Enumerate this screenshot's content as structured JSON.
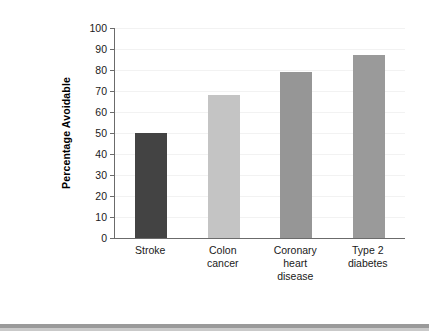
{
  "chart_data": {
    "type": "bar",
    "title": "",
    "subtitle": "",
    "xlabel": "",
    "ylabel": "Percentage Avoidable",
    "categories": [
      "Stroke",
      "Colon\ncancer",
      "Coronary\nheart\ndisease",
      "Type 2\ndiabetes"
    ],
    "values": [
      50,
      68,
      79,
      87
    ],
    "ylim": [
      0,
      100
    ],
    "y_ticks": [
      "0",
      "10",
      "20",
      "30",
      "40",
      "50",
      "60",
      "70",
      "80",
      "90",
      "100"
    ],
    "y_tick_values": [
      0,
      10,
      20,
      30,
      40,
      50,
      60,
      70,
      80,
      90,
      100
    ],
    "grid": true,
    "legend": "none",
    "bar_colors": [
      "#434343",
      "#c4c4c4",
      "#969696",
      "#9a9a9a"
    ],
    "axis_color": "#6b6b6b",
    "gridline_color": "#f2f2f2",
    "background": "#ffffff",
    "annotations": []
  },
  "figure": {
    "bottom_rule_color": "#9a9a9a"
  }
}
